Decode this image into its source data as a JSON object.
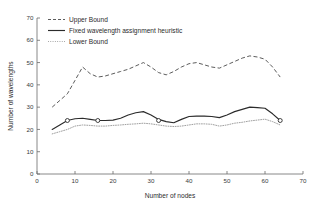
{
  "chart_data": {
    "type": "line",
    "title": "",
    "xlabel": "Number of nodes",
    "ylabel": "Number of wavelengths",
    "xlim": [
      0,
      70
    ],
    "ylim": [
      0,
      70
    ],
    "xticks": [
      0,
      10,
      20,
      30,
      40,
      50,
      60,
      70
    ],
    "yticks": [
      0,
      10,
      20,
      30,
      40,
      50,
      60,
      70
    ],
    "grid": false,
    "legend_position": "upper-left-inside",
    "series": [
      {
        "name": "Upper Bound",
        "style": "dashed",
        "color": "#4a4a4a",
        "marker": "none",
        "x": [
          4,
          6,
          8,
          10,
          12,
          14,
          16,
          18,
          20,
          22,
          24,
          26,
          28,
          30,
          32,
          34,
          36,
          38,
          40,
          42,
          44,
          46,
          48,
          50,
          52,
          54,
          56,
          58,
          60,
          62,
          64
        ],
        "y": [
          30,
          33,
          36,
          42,
          48,
          45,
          43.5,
          44,
          45,
          46,
          47,
          48.5,
          50,
          48,
          45.5,
          44.5,
          46,
          48,
          49.5,
          50,
          49,
          48,
          47.5,
          49,
          50.5,
          52,
          53,
          52.5,
          51.5,
          48,
          43.5
        ]
      },
      {
        "name": "Fixed wavelength assignment heuristic",
        "style": "solid",
        "color": "#2b2b2b",
        "marker": "circle",
        "marker_x": [
          8,
          16,
          32,
          64
        ],
        "marker_y": [
          24,
          24,
          24,
          24
        ],
        "x": [
          4,
          6,
          8,
          10,
          12,
          14,
          16,
          18,
          20,
          22,
          24,
          26,
          28,
          30,
          32,
          34,
          36,
          38,
          40,
          42,
          44,
          46,
          48,
          50,
          52,
          54,
          56,
          58,
          60,
          62,
          64
        ],
        "y": [
          20,
          22,
          24,
          24.8,
          25,
          24.5,
          24,
          24,
          24.2,
          25,
          26.5,
          27.5,
          28,
          26.5,
          24.5,
          23.5,
          23,
          24.5,
          25.8,
          26,
          26,
          25.8,
          25.3,
          26.5,
          28,
          29,
          30,
          29.8,
          29.5,
          27,
          24
        ]
      },
      {
        "name": "Lower Bound",
        "style": "dotted",
        "color": "#8e8e8e",
        "marker": "none",
        "x": [
          4,
          6,
          8,
          10,
          12,
          14,
          16,
          18,
          20,
          22,
          24,
          26,
          28,
          30,
          32,
          34,
          36,
          38,
          40,
          42,
          44,
          46,
          48,
          50,
          52,
          54,
          56,
          58,
          60,
          62,
          64
        ],
        "y": [
          18,
          19,
          20,
          21.5,
          22,
          21.8,
          21.5,
          21.5,
          21.8,
          22,
          22.3,
          22.5,
          22.8,
          22.5,
          22,
          21.5,
          21.3,
          21.5,
          22,
          22.5,
          22.5,
          22.3,
          21.5,
          22,
          22.8,
          23.2,
          23.8,
          24.2,
          24.6,
          23.5,
          22
        ]
      }
    ]
  },
  "legend": {
    "entries": [
      {
        "label": "Upper Bound",
        "sample": "dashed-line-sample"
      },
      {
        "label": "Fixed wavelength assignment heuristic",
        "sample": "solid-line-sample"
      },
      {
        "label": "Lower Bound",
        "sample": "dotted-line-sample"
      }
    ]
  },
  "axes": {
    "x_tick_labels": [
      "0",
      "10",
      "20",
      "30",
      "40",
      "50",
      "60",
      "70"
    ],
    "y_tick_labels": [
      "0",
      "10",
      "20",
      "30",
      "40",
      "50",
      "60",
      "70"
    ],
    "x_title": "Number of nodes",
    "y_title": "Number of wavelengths"
  }
}
